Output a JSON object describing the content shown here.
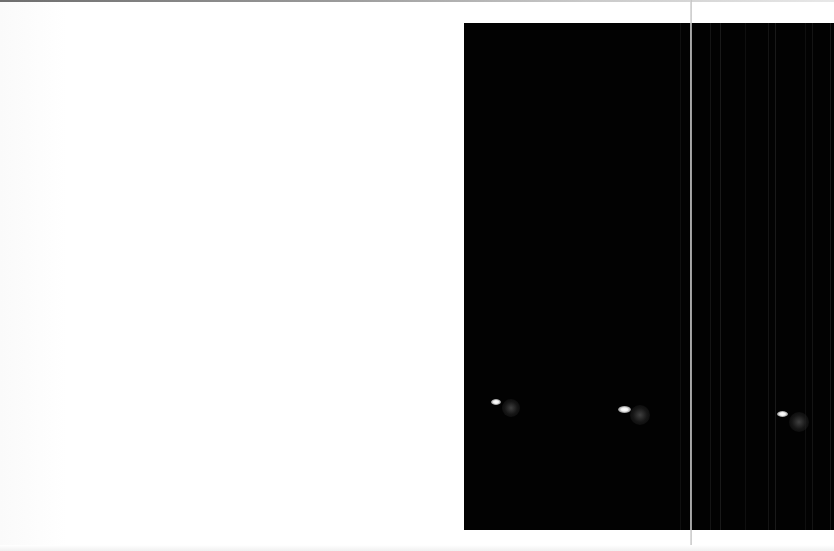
{
  "scene": {
    "description": "Scanned page: blank white left half, black photographic panel on the right showing three bright spots each with a faint offset halo",
    "colors": {
      "page_background": "#ffffff",
      "panel_background": "#020202",
      "spot_core": "#ffffff",
      "halo": "#464646",
      "fold_line": "#c8c8c8"
    },
    "panel": {
      "x": 464,
      "y": 23,
      "width": 370,
      "height": 507
    },
    "fold_line_x": 690,
    "spots": [
      {
        "label": "spot-1",
        "x": 496,
        "y": 402,
        "core_w": 10,
        "core_h": 6,
        "halo_x": 511,
        "halo_y": 408,
        "halo_r": 9
      },
      {
        "label": "spot-2",
        "x": 624,
        "y": 409,
        "core_w": 13,
        "core_h": 7,
        "halo_x": 640,
        "halo_y": 415,
        "halo_r": 10
      },
      {
        "label": "spot-3",
        "x": 782,
        "y": 414,
        "core_w": 11,
        "core_h": 6,
        "halo_x": 799,
        "halo_y": 422,
        "halo_r": 10
      }
    ],
    "streaks_x": [
      680,
      710,
      720,
      745,
      768,
      775,
      805,
      812,
      830
    ]
  }
}
